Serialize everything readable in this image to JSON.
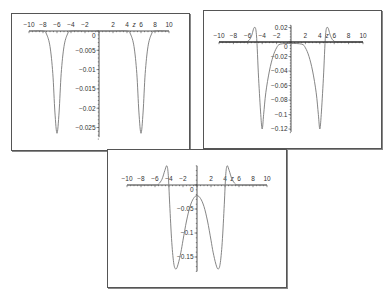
{
  "chart_data": [
    {
      "id": "plot-1",
      "type": "line",
      "title": "",
      "xlabel": "z",
      "ylabel": "",
      "xlim": [
        -10,
        10
      ],
      "ylim": [
        -0.028,
        0.0
      ],
      "x_ticks": [
        -10,
        -8,
        -6,
        -4,
        -2,
        2,
        4,
        6,
        8,
        10
      ],
      "y_ticks": [
        0,
        -0.005,
        -0.01,
        -0.015,
        -0.02,
        -0.025
      ],
      "y_tick_labels": [
        "0",
        "-0.005",
        "-0.01",
        "-0.015",
        "-0.02",
        "-0.025"
      ],
      "grid": false,
      "legend": null,
      "series": [
        {
          "name": "curve",
          "description": "two narrow symmetric wells centered at z=±6",
          "x": [
            -10,
            -8,
            -7.5,
            -7,
            -6.6,
            -6.3,
            -6,
            -5.7,
            -5.4,
            -5,
            -4.5,
            -4,
            -2,
            0,
            2,
            4,
            4.5,
            5,
            5.4,
            5.7,
            6,
            6.3,
            6.6,
            7,
            7.5,
            8,
            10
          ],
          "y": [
            0,
            0,
            -0.0008,
            -0.004,
            -0.011,
            -0.021,
            -0.0265,
            -0.021,
            -0.011,
            -0.004,
            -0.0008,
            0,
            0,
            0,
            0,
            0,
            -0.0008,
            -0.004,
            -0.011,
            -0.021,
            -0.0265,
            -0.021,
            -0.011,
            -0.004,
            -0.0008,
            0,
            0
          ]
        }
      ]
    },
    {
      "id": "plot-2",
      "type": "line",
      "title": "",
      "xlabel": "z",
      "ylabel": "",
      "xlim": [
        -10,
        10
      ],
      "ylim": [
        -0.125,
        0.025
      ],
      "x_ticks": [
        -10,
        -8,
        -6,
        -4,
        -2,
        2,
        4,
        6,
        8,
        10
      ],
      "y_ticks": [
        0.02,
        0,
        -0.02,
        -0.04,
        -0.06,
        -0.08,
        -0.1,
        -0.12
      ],
      "y_tick_labels": [
        "0.02",
        "0",
        "-0.02",
        "-0.04",
        "-0.06",
        "-0.08",
        "-0.1",
        "-0.12"
      ],
      "grid": false,
      "legend": null,
      "series": [
        {
          "name": "curve-a",
          "description": "flat-bottom well with sharp minima near z=±4 and small positive bumps near z=±5",
          "x": [
            -10,
            -7,
            -6,
            -5.5,
            -5.1,
            -4.8,
            -4.5,
            -4.2,
            -4,
            -3.8,
            -3.5,
            -3,
            -2.5,
            -2,
            -1.5,
            0,
            1.5,
            2,
            2.5,
            3,
            3.5,
            3.8,
            4,
            4.2,
            4.5,
            4.8,
            5.1,
            5.5,
            6,
            7,
            10
          ],
          "y": [
            0,
            0,
            0.001,
            0.008,
            0.02,
            0.01,
            -0.05,
            -0.1,
            -0.12,
            -0.1,
            -0.07,
            -0.04,
            -0.02,
            -0.008,
            -0.003,
            -0.002,
            -0.003,
            -0.008,
            -0.02,
            -0.04,
            -0.07,
            -0.1,
            -0.12,
            -0.1,
            -0.05,
            0.01,
            0.02,
            0.008,
            0.001,
            0,
            0
          ]
        },
        {
          "name": "curve-b",
          "description": "near-zero baseline curve",
          "x": [
            -10,
            10
          ],
          "y": [
            0,
            0
          ]
        }
      ]
    },
    {
      "id": "plot-3",
      "type": "line",
      "title": "",
      "xlabel": "z",
      "ylabel": "",
      "xlim": [
        -10,
        10
      ],
      "ylim": [
        -0.18,
        0.04
      ],
      "x_ticks": [
        -10,
        -8,
        -6,
        -4,
        -2,
        2,
        4,
        6,
        8,
        10
      ],
      "y_ticks": [
        0,
        -0.05,
        -0.1,
        -0.15
      ],
      "y_tick_labels": [
        "0",
        "-0.05",
        "-0.1",
        "-0.15"
      ],
      "grid": false,
      "legend": null,
      "series": [
        {
          "name": "curve",
          "description": "double well with minima near z=±3 (~-0.175), central hump ~-0.022 at z=0, positive bumps ~0.04 near z=±4.3",
          "x": [
            -10,
            -6,
            -5.5,
            -5,
            -4.6,
            -4.3,
            -4.1,
            -3.9,
            -3.6,
            -3.3,
            -3,
            -2.7,
            -2.3,
            -2,
            -1.5,
            -1,
            -0.5,
            0,
            0.5,
            1,
            1.5,
            2,
            2.3,
            2.7,
            3,
            3.3,
            3.6,
            3.9,
            4.1,
            4.3,
            4.6,
            5,
            5.5,
            6,
            10
          ],
          "y": [
            0,
            0,
            0.002,
            0.012,
            0.03,
            0.04,
            0.02,
            -0.04,
            -0.12,
            -0.165,
            -0.175,
            -0.165,
            -0.14,
            -0.115,
            -0.075,
            -0.045,
            -0.028,
            -0.022,
            -0.028,
            -0.045,
            -0.075,
            -0.115,
            -0.14,
            -0.165,
            -0.175,
            -0.165,
            -0.12,
            -0.04,
            0.02,
            0.04,
            0.03,
            0.012,
            0.002,
            0,
            0
          ]
        }
      ]
    }
  ],
  "panels": [
    {
      "name": "plot-1",
      "box": [
        11,
        13,
        177,
        136
      ],
      "origin": [
        87,
        17
      ],
      "x_unit": 7.0,
      "y_per_unit": 3860,
      "y_axis_top": 0,
      "y_axis_bottom": -0.0275
    },
    {
      "name": "plot-2",
      "box": [
        203,
        10,
        177,
        137
      ],
      "origin": [
        87,
        31
      ],
      "x_unit": 7.2,
      "y_per_unit": 725,
      "y_axis_top": 0.023,
      "y_axis_bottom": -0.124
    },
    {
      "name": "plot-3",
      "box": [
        107,
        149,
        178,
        137
      ],
      "origin": [
        89,
        35
      ],
      "x_unit": 7.0,
      "y_per_unit": 480,
      "y_axis_top": 0.04,
      "y_axis_bottom": -0.18
    }
  ],
  "axis_variable": "z"
}
